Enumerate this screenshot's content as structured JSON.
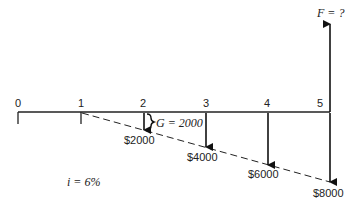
{
  "diagram": {
    "type": "cash-flow-diagram",
    "periods": [
      "0",
      "1",
      "2",
      "3",
      "4",
      "5"
    ],
    "future_value_label": "F = ?",
    "gradient_label": "G = 2000",
    "interest_label": "i = 6%",
    "cash_flows": [
      {
        "period": "2",
        "label": "$2000"
      },
      {
        "period": "3",
        "label": "$4000"
      },
      {
        "period": "4",
        "label": "$6000"
      },
      {
        "period": "5",
        "label": "$8000"
      }
    ]
  }
}
